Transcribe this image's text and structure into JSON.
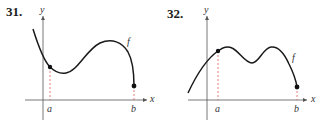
{
  "exercises": [
    {
      "number": "31.",
      "x_axis_label": "x",
      "y_axis_label": "y",
      "function_label": "f",
      "point_a_label": "a",
      "point_b_label": "b",
      "description": "Curve decreasing from upper left, crossing endpoint a, dipping to a local minimum, rising to a local maximum, then falling steeply to endpoint b"
    },
    {
      "number": "32.",
      "x_axis_label": "x",
      "y_axis_label": "y",
      "function_label": "f",
      "point_a_label": "a",
      "point_b_label": "b",
      "description": "Curve rising from lower left through endpoint a to a local maximum, dipping to a local minimum, rising to a second local maximum, then falling to endpoint b"
    }
  ],
  "colors": {
    "curve": "#1a1a1a",
    "axis": "#555555",
    "dashed_guide": "#e05a5a",
    "point": "#111111"
  }
}
